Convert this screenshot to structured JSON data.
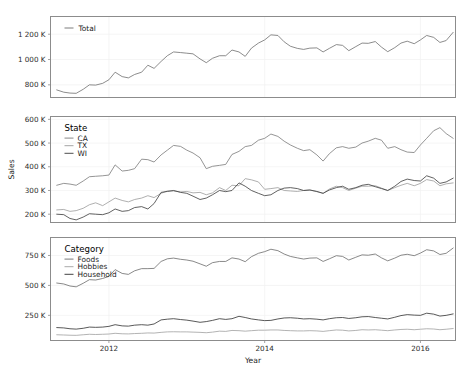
{
  "figure": {
    "background": "#ffffff",
    "xlabel": "Year",
    "ylabel": "Sales",
    "x_ticks": [
      "2012",
      "2014",
      "2016"
    ],
    "x_tick_values": [
      2012,
      2014,
      2016
    ],
    "xlim": [
      2011.25,
      2016.45
    ],
    "grid": true,
    "panel_count": 3
  },
  "chart_data": [
    {
      "type": "line",
      "title": "",
      "xlabel": "",
      "ylabel": "",
      "legend_title": "Total",
      "legend_position": "top-left-inside",
      "ylim": [
        700000,
        1340000
      ],
      "y_ticks": [
        800000,
        1000000,
        1200000
      ],
      "y_tick_labels": [
        "800 K",
        "1 000 K",
        "1 200 K"
      ],
      "x": [
        2011.33,
        2011.42,
        2011.5,
        2011.58,
        2011.67,
        2011.75,
        2011.83,
        2011.92,
        2012.0,
        2012.08,
        2012.17,
        2012.25,
        2012.33,
        2012.42,
        2012.5,
        2012.58,
        2012.67,
        2012.75,
        2012.83,
        2012.92,
        2013.0,
        2013.08,
        2013.17,
        2013.25,
        2013.33,
        2013.42,
        2013.5,
        2013.58,
        2013.67,
        2013.75,
        2013.83,
        2013.92,
        2014.0,
        2014.08,
        2014.17,
        2014.25,
        2014.33,
        2014.42,
        2014.5,
        2014.58,
        2014.67,
        2014.75,
        2014.83,
        2014.92,
        2015.0,
        2015.08,
        2015.17,
        2015.25,
        2015.33,
        2015.42,
        2015.5,
        2015.58,
        2015.67,
        2015.75,
        2015.83,
        2015.92,
        2016.0,
        2016.08,
        2016.17,
        2016.25,
        2016.33,
        2016.42
      ],
      "series": [
        {
          "name": "Total",
          "color": "#6e6e6e",
          "values": [
            760000,
            742000,
            735000,
            733000,
            765000,
            800000,
            798000,
            812000,
            840000,
            900000,
            865000,
            855000,
            882000,
            900000,
            955000,
            930000,
            985000,
            1030000,
            1060000,
            1055000,
            1050000,
            1045000,
            1005000,
            975000,
            1010000,
            1030000,
            1030000,
            1075000,
            1060000,
            1025000,
            1090000,
            1130000,
            1155000,
            1195000,
            1190000,
            1140000,
            1105000,
            1088000,
            1080000,
            1090000,
            1092000,
            1060000,
            1088000,
            1118000,
            1112000,
            1070000,
            1102000,
            1130000,
            1128000,
            1142000,
            1098000,
            1062000,
            1094000,
            1130000,
            1145000,
            1125000,
            1155000,
            1190000,
            1175000,
            1135000,
            1150000,
            1215000,
            1250000,
            1260000,
            1290000,
            1330000
          ]
        }
      ]
    },
    {
      "type": "line",
      "title": "",
      "xlabel": "",
      "ylabel": "Sales",
      "legend_title": "State",
      "legend_position": "top-left-inside",
      "ylim": [
        165000,
        612000
      ],
      "y_ticks": [
        200000,
        300000,
        400000,
        500000,
        600000
      ],
      "y_tick_labels": [
        "200 K",
        "300 K",
        "400 K",
        "500 K",
        "600 K"
      ],
      "series": [
        {
          "name": "CA",
          "color": "#7a7a7a",
          "values": [
            322000,
            330000,
            327000,
            322000,
            340000,
            358000,
            360000,
            362000,
            365000,
            408000,
            382000,
            385000,
            392000,
            432000,
            430000,
            420000,
            450000,
            470000,
            490000,
            486000,
            470000,
            458000,
            438000,
            392000,
            402000,
            406000,
            410000,
            452000,
            465000,
            485000,
            490000,
            512000,
            520000,
            538000,
            528000,
            508000,
            492000,
            478000,
            468000,
            472000,
            450000,
            424000,
            455000,
            480000,
            485000,
            478000,
            483000,
            500000,
            508000,
            520000,
            512000,
            478000,
            485000,
            472000,
            462000,
            460000,
            492000,
            520000,
            552000,
            565000,
            540000,
            520000,
            478000,
            495000,
            520000,
            578000
          ]
        },
        {
          "name": "TX",
          "color": "#9a9a9a",
          "values": [
            218000,
            220000,
            212000,
            215000,
            225000,
            240000,
            248000,
            236000,
            252000,
            268000,
            258000,
            252000,
            262000,
            268000,
            278000,
            270000,
            288000,
            298000,
            298000,
            294000,
            296000,
            290000,
            292000,
            282000,
            290000,
            312000,
            300000,
            322000,
            320000,
            350000,
            345000,
            336000,
            305000,
            308000,
            312000,
            300000,
            298000,
            296000,
            300000,
            302000,
            295000,
            288000,
            306000,
            318000,
            312000,
            300000,
            310000,
            318000,
            318000,
            320000,
            310000,
            300000,
            312000,
            322000,
            330000,
            320000,
            330000,
            346000,
            340000,
            320000,
            328000,
            332000,
            330000,
            338000,
            348000,
            358000
          ]
        },
        {
          "name": "WI",
          "color": "#3a3a3a",
          "values": [
            200000,
            198000,
            182000,
            176000,
            188000,
            202000,
            200000,
            198000,
            206000,
            222000,
            212000,
            215000,
            228000,
            232000,
            222000,
            245000,
            292000,
            296000,
            300000,
            292000,
            288000,
            276000,
            262000,
            268000,
            282000,
            300000,
            295000,
            300000,
            332000,
            318000,
            300000,
            288000,
            278000,
            282000,
            300000,
            310000,
            312000,
            308000,
            300000,
            302000,
            296000,
            288000,
            302000,
            312000,
            318000,
            305000,
            312000,
            322000,
            326000,
            316000,
            308000,
            300000,
            318000,
            338000,
            348000,
            342000,
            340000,
            362000,
            352000,
            330000,
            336000,
            352000,
            368000,
            382000,
            396000,
            412000
          ]
        }
      ]
    },
    {
      "type": "line",
      "title": "",
      "xlabel": "Year",
      "ylabel": "",
      "legend_title": "Category",
      "legend_position": "top-left-inside",
      "ylim": [
        40000,
        900000
      ],
      "y_ticks": [
        250000,
        500000,
        750000
      ],
      "y_tick_labels": [
        "250 K",
        "500 K",
        "750 K"
      ],
      "series": [
        {
          "name": "Foods",
          "color": "#6b6b6b",
          "values": [
            520000,
            512000,
            495000,
            488000,
            518000,
            548000,
            545000,
            558000,
            575000,
            632000,
            600000,
            592000,
            622000,
            640000,
            640000,
            642000,
            700000,
            722000,
            728000,
            718000,
            712000,
            702000,
            680000,
            660000,
            690000,
            700000,
            700000,
            730000,
            720000,
            698000,
            740000,
            768000,
            782000,
            802000,
            790000,
            762000,
            742000,
            730000,
            720000,
            728000,
            730000,
            700000,
            722000,
            748000,
            742000,
            712000,
            735000,
            755000,
            752000,
            762000,
            730000,
            705000,
            728000,
            752000,
            760000,
            748000,
            770000,
            798000,
            788000,
            758000,
            768000,
            812000,
            832000,
            838000,
            858000,
            882000
          ]
        },
        {
          "name": "Hobbies",
          "color": "#a0a0a0",
          "values": [
            88000,
            86000,
            84000,
            83000,
            88000,
            92000,
            90000,
            92000,
            94000,
            100000,
            96000,
            95000,
            98000,
            100000,
            103000,
            102000,
            108000,
            112000,
            113000,
            112000,
            112000,
            110000,
            108000,
            105000,
            110000,
            118000,
            116000,
            124000,
            122000,
            118000,
            122000,
            126000,
            126000,
            128000,
            128000,
            124000,
            122000,
            120000,
            120000,
            122000,
            120000,
            116000,
            122000,
            128000,
            126000,
            120000,
            124000,
            130000,
            128000,
            130000,
            126000,
            122000,
            128000,
            132000,
            134000,
            130000,
            134000,
            138000,
            136000,
            130000,
            134000,
            140000,
            142000,
            144000,
            146000,
            150000
          ]
        },
        {
          "name": "Household",
          "color": "#2e2e2e",
          "values": [
            148000,
            145000,
            138000,
            135000,
            142000,
            152000,
            150000,
            152000,
            158000,
            172000,
            162000,
            160000,
            168000,
            172000,
            168000,
            178000,
            212000,
            218000,
            222000,
            215000,
            210000,
            202000,
            192000,
            198000,
            208000,
            222000,
            216000,
            222000,
            242000,
            232000,
            220000,
            212000,
            206000,
            208000,
            220000,
            228000,
            230000,
            226000,
            220000,
            222000,
            218000,
            212000,
            222000,
            230000,
            232000,
            224000,
            230000,
            238000,
            240000,
            232000,
            226000,
            220000,
            234000,
            248000,
            256000,
            252000,
            250000,
            268000,
            260000,
            244000,
            250000,
            262000,
            272000,
            282000,
            292000,
            302000
          ]
        }
      ]
    }
  ]
}
